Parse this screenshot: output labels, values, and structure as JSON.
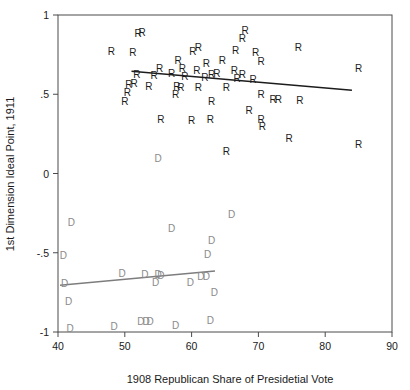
{
  "chart_data": {
    "type": "scatter",
    "title": "",
    "xlabel": "1908 Republican Share of Presidetial Vote",
    "ylabel": "1st Dimension Ideal Point, 1911",
    "xlim": [
      40,
      90
    ],
    "ylim": [
      -1,
      1
    ],
    "xticks": [
      40,
      50,
      60,
      70,
      80,
      90
    ],
    "xticklabels": [
      "40",
      "50",
      "60",
      "70",
      "80",
      "90"
    ],
    "yticks": [
      -1,
      -0.5,
      0,
      0.5,
      1
    ],
    "yticklabels": [
      "-1",
      "-.5",
      "0",
      ".5",
      "1"
    ],
    "grid": false,
    "legend": "none",
    "series": [
      {
        "name": "Republicans",
        "marker": "R",
        "color": "#1c1c1c",
        "points": [
          [
            52.0,
            0.885
          ],
          [
            52.6,
            0.89
          ],
          [
            68.0,
            0.905
          ],
          [
            67.6,
            0.855
          ],
          [
            48.0,
            0.77
          ],
          [
            51.2,
            0.765
          ],
          [
            61.0,
            0.8
          ],
          [
            60.2,
            0.775
          ],
          [
            66.6,
            0.78
          ],
          [
            69.6,
            0.765
          ],
          [
            76.0,
            0.8
          ],
          [
            58.0,
            0.715
          ],
          [
            62.2,
            0.7
          ],
          [
            64.6,
            0.715
          ],
          [
            70.4,
            0.71
          ],
          [
            55.2,
            0.665
          ],
          [
            58.6,
            0.665
          ],
          [
            60.8,
            0.655
          ],
          [
            66.4,
            0.655
          ],
          [
            57.0,
            0.635
          ],
          [
            63.0,
            0.63
          ],
          [
            63.8,
            0.635
          ],
          [
            67.6,
            0.63
          ],
          [
            85.0,
            0.665
          ],
          [
            51.8,
            0.625
          ],
          [
            54.4,
            0.62
          ],
          [
            59.0,
            0.615
          ],
          [
            62.0,
            0.61
          ],
          [
            66.8,
            0.6
          ],
          [
            69.2,
            0.595
          ],
          [
            50.6,
            0.565
          ],
          [
            51.4,
            0.57
          ],
          [
            53.6,
            0.55
          ],
          [
            57.8,
            0.555
          ],
          [
            58.4,
            0.545
          ],
          [
            61.0,
            0.545
          ],
          [
            65.2,
            0.545
          ],
          [
            50.4,
            0.515
          ],
          [
            57.6,
            0.5
          ],
          [
            70.4,
            0.5
          ],
          [
            50.0,
            0.455
          ],
          [
            63.0,
            0.455
          ],
          [
            72.2,
            0.47
          ],
          [
            73.0,
            0.47
          ],
          [
            76.2,
            0.465
          ],
          [
            68.6,
            0.4
          ],
          [
            55.4,
            0.345
          ],
          [
            60.0,
            0.34
          ],
          [
            62.8,
            0.345
          ],
          [
            70.4,
            0.345
          ],
          [
            70.6,
            0.3
          ],
          [
            74.6,
            0.225
          ],
          [
            65.2,
            0.145
          ],
          [
            85.0,
            0.185
          ]
        ]
      },
      {
        "name": "Democrats",
        "marker": "D",
        "color": "#8a8a8a",
        "points": [
          [
            55.0,
            0.1
          ],
          [
            42.0,
            -0.305
          ],
          [
            57.0,
            -0.345
          ],
          [
            66.0,
            -0.255
          ],
          [
            63.0,
            -0.42
          ],
          [
            62.4,
            -0.505
          ],
          [
            40.8,
            -0.515
          ],
          [
            49.6,
            -0.625
          ],
          [
            53.0,
            -0.635
          ],
          [
            55.0,
            -0.635
          ],
          [
            55.4,
            -0.64
          ],
          [
            41.0,
            -0.69
          ],
          [
            54.6,
            -0.685
          ],
          [
            59.8,
            -0.685
          ],
          [
            61.4,
            -0.645
          ],
          [
            62.2,
            -0.645
          ],
          [
            63.4,
            -0.745
          ],
          [
            41.6,
            -0.805
          ],
          [
            41.8,
            -0.975
          ],
          [
            48.4,
            -0.965
          ],
          [
            52.4,
            -0.93
          ],
          [
            53.2,
            -0.93
          ],
          [
            53.8,
            -0.93
          ],
          [
            57.6,
            -0.955
          ],
          [
            62.8,
            -0.925
          ]
        ]
      }
    ],
    "fit_lines": [
      {
        "name": "republican-fit",
        "color": "#1c1c1c",
        "x": [
          51.0,
          84.0
        ],
        "y": [
          0.645,
          0.525
        ]
      },
      {
        "name": "democrat-fit",
        "color": "#7d7d7d",
        "x": [
          40.3,
          63.5
        ],
        "y": [
          -0.705,
          -0.615
        ]
      }
    ]
  }
}
